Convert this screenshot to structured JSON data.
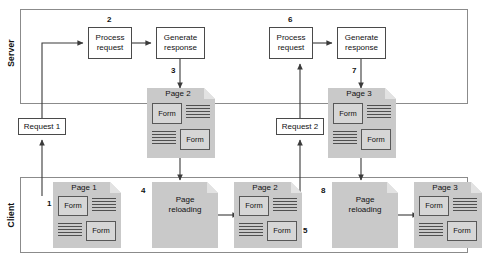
{
  "diagram": {
    "lanes": [
      {
        "id": "server",
        "label": "Server"
      },
      {
        "id": "client",
        "label": "Client"
      }
    ],
    "colors": {
      "lane_border": "#8b8b8b",
      "box_border": "#4a4a4a",
      "box_fill": "#ffffff",
      "doc_fill": "#c9c9c9",
      "doc_corner": "#e2e2e2",
      "form_fill": "#d6d6d6",
      "form_border": "#585858",
      "line": "#3a3a3a",
      "text": "#111111"
    }
  },
  "server": {
    "cycle1": {
      "process": {
        "line1": "Process",
        "line2": "request"
      },
      "generate": {
        "line1": "Generate",
        "line2": "response"
      }
    },
    "cycle2": {
      "process": {
        "line1": "Process",
        "line2": "request"
      },
      "generate": {
        "line1": "Generate",
        "line2": "response"
      }
    }
  },
  "requests": {
    "request1": "Request 1",
    "request2": "Request 2"
  },
  "pages": {
    "response_page2": {
      "title": "Page 2",
      "form_top": "Form",
      "form_bottom": "Form"
    },
    "response_page3": {
      "title": "Page 3",
      "form_top": "Form",
      "form_bottom": "Form"
    },
    "client_page1": {
      "title": "Page 1",
      "form_top": "Form",
      "form_bottom": "Form"
    },
    "client_page2": {
      "title": "Page 2",
      "form_top": "Form",
      "form_bottom": "Form"
    },
    "client_page3": {
      "title": "Page 3",
      "form_top": "Form",
      "form_bottom": "Form"
    }
  },
  "reloading": {
    "first": {
      "line1": "Page",
      "line2": "reloading"
    },
    "second": {
      "line1": "Page",
      "line2": "reloading"
    }
  },
  "steps": {
    "s1": "1",
    "s2": "2",
    "s3": "3",
    "s4": "4",
    "s5": "5",
    "s6": "6",
    "s7": "7",
    "s8": "8"
  }
}
